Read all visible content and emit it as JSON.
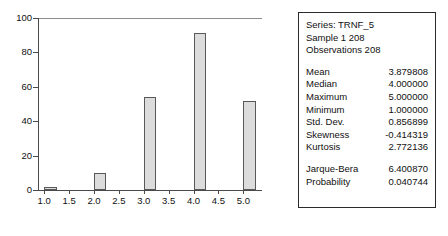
{
  "chart_data": {
    "type": "bar",
    "title": "",
    "xlabel": "",
    "ylabel": "",
    "categories": [
      "1.0",
      "2.0",
      "3.0",
      "4.0",
      "5.0"
    ],
    "values": [
      2,
      10,
      54,
      91,
      52
    ],
    "x": [
      1.0,
      2.0,
      3.0,
      4.0,
      5.0
    ],
    "bar_width": 0.25,
    "xlim": [
      0.875,
      5.375
    ],
    "ylim": [
      0,
      100
    ],
    "xticks": [
      "1.0",
      "1.5",
      "2.0",
      "2.5",
      "3.0",
      "3.5",
      "4.0",
      "4.5",
      "5.0"
    ],
    "yticks": [
      "0",
      "20",
      "40",
      "60",
      "80",
      "100"
    ],
    "grid": false,
    "legend": "none",
    "bar_color": "#dcdcdc",
    "bar_edge_color": "#595959"
  },
  "axes": {
    "y_ticks": [
      {
        "label": "100",
        "value": 100
      },
      {
        "label": "80",
        "value": 80
      },
      {
        "label": "60",
        "value": 60
      },
      {
        "label": "40",
        "value": 40
      },
      {
        "label": "20",
        "value": 20
      },
      {
        "label": "0",
        "value": 0
      }
    ],
    "x_ticks": [
      {
        "label": "1.0",
        "value": 1.0
      },
      {
        "label": "1.5",
        "value": 1.5
      },
      {
        "label": "2.0",
        "value": 2.0
      },
      {
        "label": "2.5",
        "value": 2.5
      },
      {
        "label": "3.0",
        "value": 3.0
      },
      {
        "label": "3.5",
        "value": 3.5
      },
      {
        "label": "4.0",
        "value": 4.0
      },
      {
        "label": "4.5",
        "value": 4.5
      },
      {
        "label": "5.0",
        "value": 5.0
      }
    ]
  },
  "stats_panel": {
    "header": [
      "Series: TRNF_5",
      "Sample 1 208",
      "Observations 208"
    ],
    "rows": [
      {
        "key": "Mean",
        "value": "3.879808"
      },
      {
        "key": "Median",
        "value": "4.000000"
      },
      {
        "key": "Maximum",
        "value": "5.000000"
      },
      {
        "key": "Minimum",
        "value": "1.000000"
      },
      {
        "key": "Std. Dev.",
        "value": "0.856899"
      },
      {
        "key": "Skewness",
        "value": "-0.414319"
      },
      {
        "key": "Kurtosis",
        "value": "2.772136"
      }
    ],
    "tests": [
      {
        "key": "Jarque-Bera",
        "value": "6.400870"
      },
      {
        "key": "Probability",
        "value": "0.040744"
      }
    ]
  }
}
